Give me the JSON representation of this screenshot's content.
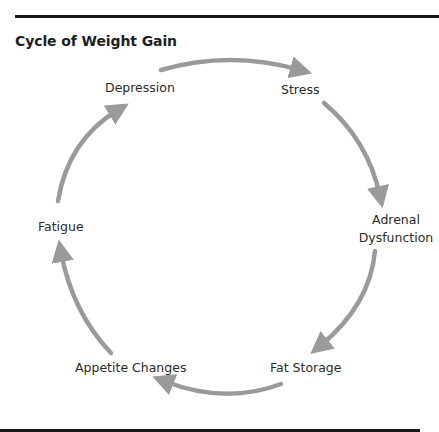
{
  "title": "Cycle of Weight Gain",
  "colors": {
    "arrow": "#9a9a9a",
    "text": "#2b2b2b",
    "rule": "#1a1a1a"
  },
  "nodes": [
    {
      "id": "depression",
      "label": "Depression"
    },
    {
      "id": "stress",
      "label": "Stress"
    },
    {
      "id": "adrenal-dysfunction",
      "label_line1": "Adrenal",
      "label_line2": "Dysfunction"
    },
    {
      "id": "fat-storage",
      "label": "Fat Storage"
    },
    {
      "id": "appetite-changes",
      "label": "Appetite Changes"
    },
    {
      "id": "fatigue",
      "label": "Fatigue"
    }
  ],
  "edges": [
    {
      "from": "Depression",
      "to": "Stress"
    },
    {
      "from": "Stress",
      "to": "Adrenal Dysfunction"
    },
    {
      "from": "Adrenal Dysfunction",
      "to": "Fat Storage"
    },
    {
      "from": "Fat Storage",
      "to": "Appetite Changes"
    },
    {
      "from": "Appetite Changes",
      "to": "Fatigue"
    },
    {
      "from": "Fatigue",
      "to": "Depression"
    }
  ]
}
